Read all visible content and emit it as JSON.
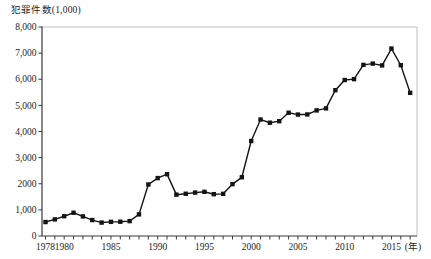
{
  "chart_data": {
    "type": "line",
    "title": "犯罪件数(1,000)",
    "ylabel": "犯罪件数(1,000)",
    "xlabel": "(年)",
    "series_name": "犯罪件数",
    "x": [
      1978,
      1979,
      1980,
      1981,
      1982,
      1983,
      1984,
      1985,
      1986,
      1987,
      1988,
      1989,
      1990,
      1991,
      1992,
      1993,
      1994,
      1995,
      1996,
      1997,
      1998,
      1999,
      2000,
      2001,
      2002,
      2003,
      2004,
      2005,
      2006,
      2007,
      2008,
      2009,
      2010,
      2011,
      2012,
      2013,
      2014,
      2015,
      2016,
      2017
    ],
    "values": [
      535,
      636,
      757,
      890,
      749,
      610,
      514,
      542,
      547,
      570,
      828,
      1972,
      2217,
      2366,
      1583,
      1617,
      1661,
      1691,
      1601,
      1614,
      1986,
      2249,
      3637,
      4458,
      4337,
      4394,
      4718,
      4648,
      4653,
      4807,
      4885,
      5580,
      5970,
      6005,
      6551,
      6599,
      6530,
      7174,
      6538,
      5480
    ],
    "ylim": [
      0,
      8000
    ],
    "xlim": [
      1977.6,
      2018.6
    ],
    "ytick_values": [
      0,
      1000,
      2000,
      3000,
      4000,
      5000,
      6000,
      7000,
      8000
    ],
    "ytick_labels": [
      "0",
      "1,000",
      "2000",
      "3,000",
      "4,000",
      "5,000",
      "6,000",
      "7,000",
      "8,000"
    ],
    "xtick_years_labeled": [
      1978,
      1980,
      1985,
      1990,
      1995,
      2000,
      2005,
      2010,
      2015
    ],
    "x_minor_tick_every_year": true,
    "grid": false,
    "legend": "none",
    "marker": "square",
    "line_color": "#141414",
    "marker_color": "#141414",
    "axis_color": "#3a3a3a",
    "frame_color": "#c0c0c0",
    "label_color": "#1e1e1e"
  }
}
